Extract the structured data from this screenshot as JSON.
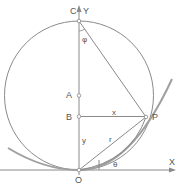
{
  "diagram": {
    "type": "geometry",
    "colors": {
      "line": "#8a8a8a",
      "curve": "#9a9a9a",
      "text": "#555555",
      "background": "#ffffff"
    },
    "labels": {
      "axis_x": "X",
      "axis_y": "Y",
      "point_c": "C",
      "point_a": "A",
      "point_b": "B",
      "point_p": "P",
      "point_o": "O",
      "seg_x": "x",
      "seg_y": "y",
      "seg_r": "r",
      "angle_phi": "φ",
      "angle_theta": "θ"
    }
  }
}
